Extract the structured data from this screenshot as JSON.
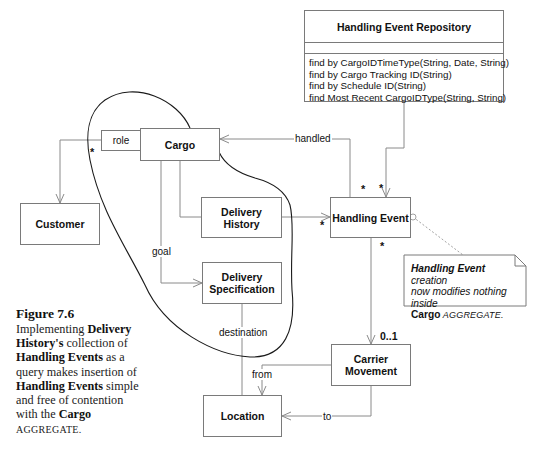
{
  "repository": {
    "name": "Handling Event Repository",
    "methods": [
      "find by CargoIDTimeType(String, Date, String)",
      "find by Cargo Tracking ID(String)",
      "find by Schedule ID(String)",
      "find Most Recent CargoIDType(String, String)"
    ]
  },
  "classes": {
    "cargo": "Cargo",
    "customer": "Customer",
    "delivery_history": "Delivery History",
    "handling_event": "Handling Event",
    "delivery_specification_line1": "Delivery",
    "delivery_specification_line2": "Specification",
    "carrier_movement_line1": "Carrier",
    "carrier_movement_line2": "Movement",
    "location": "Location"
  },
  "associations": {
    "role": "role",
    "handled": "handled",
    "goal": "goal",
    "destination": "destination",
    "from": "from",
    "to": "to"
  },
  "multiplicities": {
    "role_star": "*",
    "handled_star": "*",
    "repo_star": "*",
    "history_star": "*",
    "event_bottom_star": "*",
    "carrier_zero_one": "0..1"
  },
  "note": {
    "subject": "Handling Event",
    "text1": " creation",
    "text2": "now modifies nothing inside",
    "cargo": "Cargo",
    "aggregate": " AGGREGATE."
  },
  "caption": {
    "title": "Figure 7.6",
    "p1": "Implementing ",
    "b1": "Delivery History's",
    "p2": " collection of ",
    "b2": "Handling Events",
    "p3": " as a query makes insertion of ",
    "b3": "Handling Events",
    "p4": " simple and free of contention with the ",
    "b4": "Cargo",
    "p5": " AGGREGATE."
  },
  "colors": {
    "line": "#8a8a8a",
    "box_border": "#7a7a7a",
    "boundary": "#1a1a1a"
  }
}
